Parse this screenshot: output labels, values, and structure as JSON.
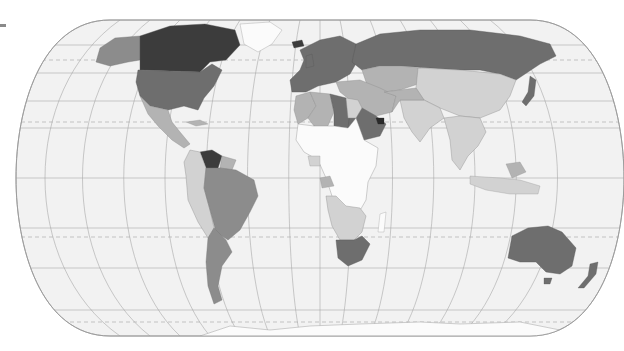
{
  "map": {
    "type": "choropleth",
    "projection": "pseudo-cylindrical (Eckert IV style)",
    "palette": {
      "ocean": "#f2f2f2",
      "outline": "#9a9a9a",
      "graticule": "#a8a8a8",
      "tropics_dashed": "#b0b0b0",
      "no_data": "#fbfbfb",
      "class_1_lightest": "#d2d2d2",
      "class_2": "#b3b3b3",
      "class_3": "#8c8c8c",
      "class_4": "#6e6e6e",
      "class_5_darkest": "#3c3c3c"
    },
    "regions": [
      {
        "name": "Canada",
        "class": "class_5_darkest"
      },
      {
        "name": "United States",
        "class": "class_4"
      },
      {
        "name": "Alaska",
        "class": "class_3"
      },
      {
        "name": "Greenland",
        "class": "no_data"
      },
      {
        "name": "Mexico",
        "class": "class_2"
      },
      {
        "name": "Central America",
        "class": "class_2"
      },
      {
        "name": "Venezuela",
        "class": "class_5_darkest"
      },
      {
        "name": "Colombia",
        "class": "class_1_lightest"
      },
      {
        "name": "Peru",
        "class": "class_1_lightest"
      },
      {
        "name": "Brazil",
        "class": "class_3"
      },
      {
        "name": "Argentina",
        "class": "class_3"
      },
      {
        "name": "Chile",
        "class": "class_3"
      },
      {
        "name": "Europe",
        "class": "class_4"
      },
      {
        "name": "Russia",
        "class": "class_4"
      },
      {
        "name": "Central Asia",
        "class": "class_2"
      },
      {
        "name": "China",
        "class": "class_1_lightest"
      },
      {
        "name": "India",
        "class": "class_1_lightest"
      },
      {
        "name": "Saudi Arabia",
        "class": "class_4"
      },
      {
        "name": "UAE",
        "class": "class_5_darkest"
      },
      {
        "name": "Iran",
        "class": "class_2"
      },
      {
        "name": "Libya",
        "class": "class_4"
      },
      {
        "name": "Algeria",
        "class": "class_2"
      },
      {
        "name": "Egypt",
        "class": "class_1_lightest"
      },
      {
        "name": "Sub-Saharan Africa",
        "class": "no_data"
      },
      {
        "name": "Angola / Southern Africa",
        "class": "class_1_lightest"
      },
      {
        "name": "South Africa",
        "class": "class_4"
      },
      {
        "name": "Southeast Asia",
        "class": "class_1_lightest"
      },
      {
        "name": "Japan",
        "class": "class_4"
      },
      {
        "name": "Australia",
        "class": "class_4"
      },
      {
        "name": "New Zealand",
        "class": "class_4"
      },
      {
        "name": "Antarctica",
        "class": "no_data"
      }
    ]
  },
  "legend": {
    "visible_fragment": "swatch-stub"
  }
}
